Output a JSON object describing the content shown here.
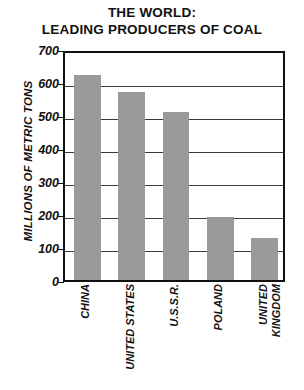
{
  "chart_data": {
    "type": "bar",
    "title": "THE WORLD: LEADING PRODUCERS OF COAL",
    "title_line1": "THE WORLD:",
    "title_line2": "LEADING PRODUCERS OF COAL",
    "xlabel": "",
    "ylabel": "MILLIONS OF METRIC TONS",
    "ylim": [
      0,
      700
    ],
    "ytick_step": 100,
    "yticks": [
      0,
      100,
      200,
      300,
      400,
      500,
      600,
      700
    ],
    "ytick_labels": [
      "0",
      "100",
      "200",
      "300",
      "400",
      "500",
      "600",
      "700"
    ],
    "grid": true,
    "legend": false,
    "bar_color": "#9a9a9a",
    "axis_color": "#111111",
    "categories": [
      "CHINA",
      "UNITED STATES",
      "U.S.S.R.",
      "POLAND",
      "UNITED KINGDOM"
    ],
    "category_lines": [
      [
        "CHINA"
      ],
      [
        "UNITED STATES"
      ],
      [
        "U.S.S.R."
      ],
      [
        "POLAND"
      ],
      [
        "UNITED",
        "KINGDOM"
      ]
    ],
    "values": [
      620,
      570,
      508,
      190,
      128
    ]
  }
}
